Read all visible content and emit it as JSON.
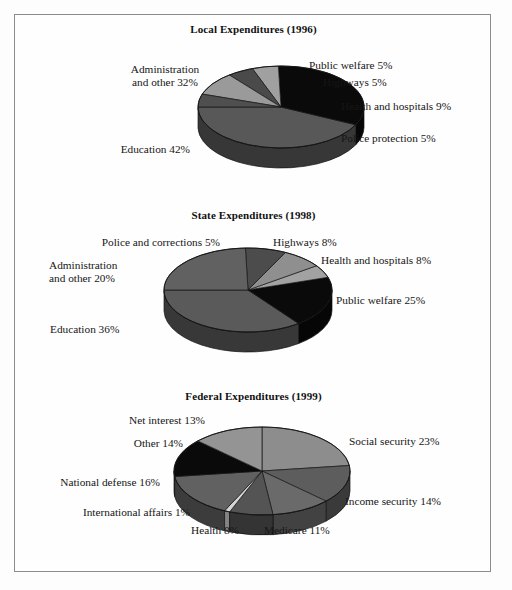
{
  "figure": {
    "background_color": "#fdfdfd",
    "frame_color": "#8c8c8c",
    "text_color": "#161616"
  },
  "chart_data": [
    {
      "type": "pie",
      "title": "Local Expenditures (1996)",
      "three_d": true,
      "start_angle_deg": 180,
      "direction": "counterclockwise",
      "categories": [
        "Education 42%",
        "Administration and other 32%",
        "Public welfare 5%",
        "Highways 5%",
        "Health and hospitals 9%",
        "Police protection 5%"
      ],
      "slices": [
        {
          "label": "Education 42%",
          "name": "Education",
          "value": 42,
          "color": "#585858"
        },
        {
          "label": "Administration\nand other 32%",
          "name": "Administration and other",
          "value": 32,
          "color": "#0a0a0a"
        },
        {
          "label": "Public welfare 5%",
          "name": "Public welfare",
          "value": 5,
          "color": "#a0a0a0"
        },
        {
          "label": "Highways 5%",
          "name": "Highways",
          "value": 5,
          "color": "#4a4a4a"
        },
        {
          "label": "Health and hospitals 9%",
          "name": "Health and hospitals",
          "value": 9,
          "color": "#9a9a9a"
        },
        {
          "label": "Police protection 5%",
          "name": "Police protection",
          "value": 5,
          "color": "#4f4f4f"
        }
      ],
      "labels": {
        "administration_l1": "Administration",
        "administration_l2": "and other 32%",
        "education": "Education 42%",
        "public_welfare": "Public welfare 5%",
        "highways": "Highways 5%",
        "health": "Health and hospitals 9%",
        "police": "Police protection 5%"
      }
    },
    {
      "type": "pie",
      "title": "State Expenditures (1998)",
      "three_d": true,
      "start_angle_deg": 180,
      "direction": "counterclockwise",
      "categories": [
        "Education 36%",
        "Administration and other 20%",
        "Police and corrections 5%",
        "Highways 8%",
        "Health and hospitals 8%",
        "Public welfare 25%"
      ],
      "slices": [
        {
          "label": "Education 36%",
          "name": "Education",
          "value": 36,
          "color": "#5a5a5a"
        },
        {
          "label": "Administration\nand other 20%",
          "name": "Administration and other",
          "value": 20,
          "color": "#0a0a0a"
        },
        {
          "label": "Police and corrections 5%",
          "name": "Police and corrections",
          "value": 5,
          "color": "#a2a2a2"
        },
        {
          "label": "Highways 8%",
          "name": "Highways",
          "value": 8,
          "color": "#8f8f8f"
        },
        {
          "label": "Health and hospitals 8%",
          "name": "Health and hospitals",
          "value": 8,
          "color": "#4c4c4c"
        },
        {
          "label": "Public welfare 25%",
          "name": "Public welfare",
          "value": 25,
          "color": "#616161"
        }
      ],
      "labels": {
        "police": "Police and corrections 5%",
        "administration_l1": "Administration",
        "administration_l2": "and other 20%",
        "education": "Education 36%",
        "highways": "Highways 8%",
        "health": "Health and hospitals 8%",
        "public_welfare": "Public welfare 25%"
      }
    },
    {
      "type": "pie",
      "title": "Federal Expenditures (1999)",
      "three_d": true,
      "start_angle_deg": 90,
      "direction": "clockwise",
      "categories": [
        "Social security 23%",
        "Income security 14%",
        "Medicare 11%",
        "Health 8%",
        "International affairs 1%",
        "National defense 16%",
        "Other 14%",
        "Net interest 13%"
      ],
      "slices": [
        {
          "label": "Social security 23%",
          "name": "Social security",
          "value": 23,
          "color": "#8d8d8d"
        },
        {
          "label": "Income security 14%",
          "name": "Income security",
          "value": 14,
          "color": "#5d5d5d"
        },
        {
          "label": "Medicare 11%",
          "name": "Medicare",
          "value": 11,
          "color": "#6a6a6a"
        },
        {
          "label": "Health 8%",
          "name": "Health",
          "value": 8,
          "color": "#545454"
        },
        {
          "label": "International affairs 1%",
          "name": "International affairs",
          "value": 1,
          "color": "#d4d4d4"
        },
        {
          "label": "National defense 16%",
          "name": "National defense",
          "value": 16,
          "color": "#616161"
        },
        {
          "label": "Other 14%",
          "name": "Other",
          "value": 14,
          "color": "#0a0a0a"
        },
        {
          "label": "Net interest 13%",
          "name": "Net interest",
          "value": 13,
          "color": "#949494"
        }
      ],
      "labels": {
        "net_interest": "Net interest 13%",
        "other": "Other 14%",
        "national_defense": "National defense 16%",
        "international_affairs": "International affairs 1%",
        "health": "Health 8%",
        "medicare": "Medicare 11%",
        "income_security": "Income security 14%",
        "social_security": "Social security 23%"
      }
    }
  ]
}
